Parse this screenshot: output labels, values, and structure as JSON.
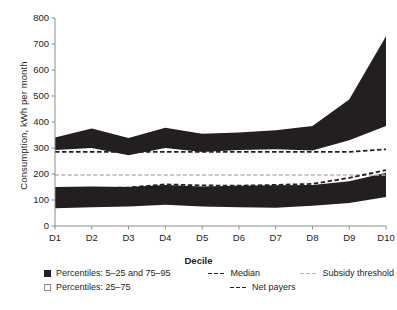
{
  "axes": {
    "y_title": "Consumption, kWh per month",
    "x_title": "Decile",
    "y_ticks": [
      "0",
      "100",
      "200",
      "300",
      "400",
      "500",
      "600",
      "700",
      "800"
    ],
    "x_ticks": [
      "D1",
      "D2",
      "D3",
      "D4",
      "D5",
      "D6",
      "D7",
      "D8",
      "D9",
      "D10"
    ]
  },
  "legend": {
    "band_outer": "Percentiles: 5–25 and 75–95",
    "band_inner": "Percentiles: 25–75",
    "median": "Median",
    "net_payers": "Net payers",
    "subsidy": "Subsidy threshold"
  },
  "colors": {
    "band": "#231f20",
    "median": "#231f20",
    "net_payers": "#231f20",
    "subsidy": "#b7b7b7",
    "axis": "#8c8c8c",
    "background": "#ffffff"
  },
  "chart_data": {
    "type": "area",
    "title": "",
    "xlabel": "Decile",
    "ylabel": "Consumption, kWh per month",
    "ylim": [
      0,
      800
    ],
    "yticks": [
      0,
      100,
      200,
      300,
      400,
      500,
      600,
      700,
      800
    ],
    "grid": false,
    "legend_position": "below",
    "categories": [
      "D1",
      "D2",
      "D3",
      "D4",
      "D5",
      "D6",
      "D7",
      "D8",
      "D9",
      "D10"
    ],
    "series": [
      {
        "name": "Percentile 95",
        "values": [
          340,
          375,
          338,
          378,
          355,
          360,
          368,
          385,
          487,
          730
        ]
      },
      {
        "name": "Percentile 75",
        "values": [
          292,
          300,
          272,
          300,
          285,
          292,
          295,
          290,
          330,
          385
        ]
      },
      {
        "name": "Percentile 25",
        "values": [
          150,
          152,
          150,
          158,
          152,
          155,
          157,
          158,
          172,
          205
        ]
      },
      {
        "name": "Percentile 5",
        "values": [
          68,
          72,
          75,
          82,
          75,
          72,
          70,
          78,
          88,
          112
        ]
      },
      {
        "name": "Median",
        "values": [
          140,
          145,
          148,
          160,
          156,
          155,
          158,
          162,
          185,
          215
        ]
      },
      {
        "name": "Net payers",
        "values": [
          285,
          285,
          285,
          285,
          285,
          285,
          285,
          285,
          285,
          295
        ]
      },
      {
        "name": "Subsidy threshold",
        "values": [
          196,
          196,
          196,
          196,
          196,
          196,
          196,
          196,
          196,
          196
        ]
      }
    ]
  }
}
